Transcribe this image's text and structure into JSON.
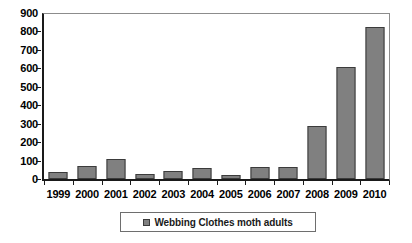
{
  "chart_data": {
    "type": "bar",
    "title": "",
    "subtitle": "",
    "xlabel": "",
    "ylabel": "",
    "categories": [
      "1999",
      "2000",
      "2001",
      "2002",
      "2003",
      "2004",
      "2005",
      "2006",
      "2007",
      "2008",
      "2009",
      "2010"
    ],
    "values": [
      38,
      70,
      107,
      28,
      41,
      62,
      23,
      63,
      64,
      290,
      605,
      823
    ],
    "series": [
      {
        "name": "Webbing Clothes moth adults",
        "values": [
          38,
          70,
          107,
          28,
          41,
          62,
          23,
          63,
          64,
          290,
          605,
          823
        ],
        "color": "#808080"
      }
    ],
    "ylim": [
      0,
      900
    ],
    "ytick_labels": [
      "900",
      "800",
      "700",
      "600",
      "500",
      "400",
      "300",
      "200",
      "100",
      "0"
    ],
    "ytick_values": [
      900,
      800,
      700,
      600,
      500,
      400,
      300,
      200,
      100,
      0
    ],
    "ytick_step": 100,
    "grid": false,
    "legend_position": "bottom",
    "bar_color": "#808080",
    "bar_border_color": "#3b3b3b",
    "axis_color": "#1a1a1a",
    "frame_color": "#8c8c8c",
    "background_color": "#ffffff"
  },
  "legend": {
    "entries": [
      {
        "label": "Webbing Clothes moth adults",
        "marker": "legend-swatch-icon",
        "color": "#808080"
      }
    ]
  }
}
